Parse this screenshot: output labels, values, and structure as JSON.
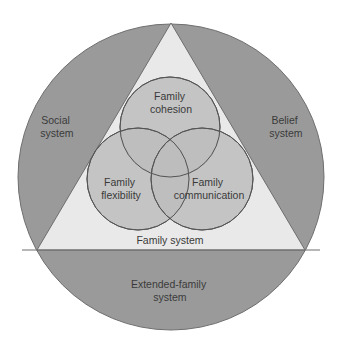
{
  "colors": {
    "background": "#ffffff",
    "outer_circle": "#9a9a9a",
    "triangle": "#e9e9e9",
    "inner_circles": "#bdbdbd",
    "stroke": "#555555",
    "text": "#3a3a3a"
  },
  "outer": {
    "regions": [
      {
        "id": "social",
        "lines": [
          "Social",
          "system"
        ]
      },
      {
        "id": "belief",
        "lines": [
          "Belief",
          "system"
        ]
      },
      {
        "id": "extended",
        "lines": [
          "Extended-family",
          "system"
        ]
      }
    ]
  },
  "triangle": {
    "label": "Family system"
  },
  "circles": [
    {
      "id": "cohesion",
      "lines": [
        "Family",
        "cohesion"
      ]
    },
    {
      "id": "flexibility",
      "lines": [
        "Family",
        "flexibility"
      ]
    },
    {
      "id": "communication",
      "lines": [
        "Family",
        "communication"
      ]
    }
  ]
}
